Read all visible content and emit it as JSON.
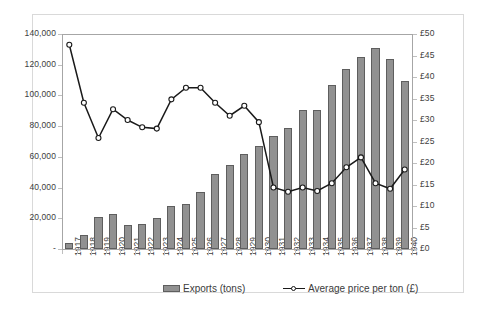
{
  "chart_data": {
    "type": "bar",
    "title": "",
    "subtitle": "",
    "xlabel": "",
    "ylabel": "",
    "y2label": "",
    "grid": false,
    "legend_position": "bottom",
    "categories": [
      "1917",
      "1918",
      "1919",
      "1920",
      "1921",
      "1922",
      "1923",
      "1924",
      "1925",
      "1926",
      "1927",
      "1928",
      "1929",
      "1930",
      "1931",
      "1932",
      "1933",
      "1934",
      "1935",
      "1936",
      "1937",
      "1938",
      "1939",
      "1940"
    ],
    "ylim": [
      0,
      140000
    ],
    "yticks": [
      "-",
      "20,000",
      "40,000",
      "60,000",
      "80,000",
      "100,000",
      "120,000",
      "140,000"
    ],
    "ytick_values": [
      0,
      20000,
      40000,
      60000,
      80000,
      100000,
      120000,
      140000
    ],
    "y2lim": [
      0,
      50
    ],
    "y2ticks": [
      "£0",
      "£5",
      "£10",
      "£15",
      "£20",
      "£25",
      "£30",
      "£35",
      "£40",
      "£45",
      "£50"
    ],
    "y2tick_values": [
      0,
      5,
      10,
      15,
      20,
      25,
      30,
      35,
      40,
      45,
      50
    ],
    "series": [
      {
        "name": "Exports (tons)",
        "type": "bar",
        "axis": "left",
        "color": "#919191",
        "border_color": "#5e5e5e",
        "values": [
          4000,
          9000,
          21000,
          22500,
          15500,
          16500,
          20500,
          28000,
          29500,
          37000,
          49000,
          54500,
          62000,
          67000,
          73500,
          79000,
          90500,
          90500,
          107000,
          117500,
          125000,
          131000,
          123500,
          109500
        ]
      },
      {
        "name": "Average price per ton (£)",
        "type": "line",
        "axis": "right",
        "color": "#1a1a1a",
        "marker": "circle-open",
        "values": [
          47.5,
          34.0,
          25.8,
          32.5,
          30.0,
          28.3,
          28.0,
          34.8,
          37.5,
          37.5,
          34.0,
          31.0,
          33.3,
          29.5,
          14.3,
          13.3,
          14.3,
          13.5,
          15.3,
          19.0,
          21.3,
          15.3,
          14.0,
          18.5
        ]
      }
    ]
  },
  "legend": {
    "bar_label": "Exports (tons)",
    "line_label": "Average price per ton (£)"
  }
}
